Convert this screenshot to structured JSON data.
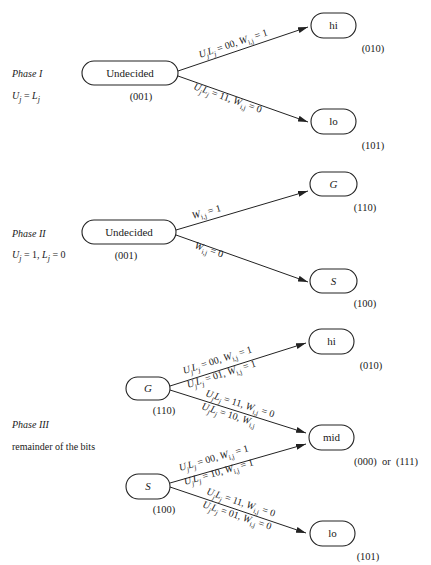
{
  "phases": [
    {
      "title": "Phase I",
      "condition": "U_j = L_j",
      "condition_display": "Uj = Lj",
      "start_node": {
        "label": "Undecided",
        "code": "(001)"
      },
      "edges": [
        {
          "from": "Undecided",
          "to": "hi",
          "labels": [
            "UjLj = 00, Wi,j = 1"
          ]
        },
        {
          "from": "Undecided",
          "to": "lo",
          "labels": [
            "UjLj = 11, Wi,j = 0"
          ]
        }
      ],
      "targets": [
        {
          "label": "hi",
          "code": "(010)"
        },
        {
          "label": "lo",
          "code": "(101)"
        }
      ]
    },
    {
      "title": "Phase II",
      "condition": "U_j = 1, L_j = 0",
      "condition_display": "Uj = 1, Lj = 0",
      "start_node": {
        "label": "Undecided",
        "code": "(001)"
      },
      "edges": [
        {
          "from": "Undecided",
          "to": "G",
          "labels": [
            "Wi,j = 1"
          ]
        },
        {
          "from": "Undecided",
          "to": "S",
          "labels": [
            "Wi,j = 0"
          ]
        }
      ],
      "targets": [
        {
          "label": "G",
          "code": "(110)"
        },
        {
          "label": "S",
          "code": "(100)"
        }
      ]
    },
    {
      "title": "Phase III",
      "condition": "remainder of the bits",
      "sources": [
        {
          "label": "G",
          "code": "(110)"
        },
        {
          "label": "S",
          "code": "(100)"
        }
      ],
      "edges": [
        {
          "from": "G",
          "to": "hi",
          "labels": [
            "UjLj = 00, Wi,j = 1",
            "UjLj = 01, Wi,j = 1"
          ]
        },
        {
          "from": "G",
          "to": "mid",
          "labels": [
            "UjLj = 11, Wi,j = 0",
            "UjLj = 10, Wi,j"
          ]
        },
        {
          "from": "S",
          "to": "mid",
          "labels": [
            "UjLj = 00, Wi,j = 1",
            "UjLj = 10, Wi,j = 1"
          ]
        },
        {
          "from": "S",
          "to": "lo",
          "labels": [
            "UjLj = 11, Wi,j = 0",
            "UjLj = 01, Wi,j = 0"
          ]
        }
      ],
      "targets": [
        {
          "label": "hi",
          "code": "(010)"
        },
        {
          "label": "mid",
          "code": "(000)  or  (111)"
        },
        {
          "label": "lo",
          "code": "(101)"
        }
      ]
    }
  ],
  "text": {
    "p1_title": "Phase I",
    "p1_U": "U",
    "p1_eq": " = ",
    "p1_L": "L",
    "sub_j": "j",
    "p2_title": "Phase II",
    "p2_U": "U",
    "p2_eq1": " = 1, ",
    "p2_L": "L",
    "p2_eq2": " = 0",
    "p3_title": "Phase III",
    "p3_sub": "remainder of the bits",
    "undecided": "Undecided",
    "hi": "hi",
    "lo": "lo",
    "mid": "mid",
    "G": "G",
    "S": "S",
    "c001": "(001)",
    "c010": "(010)",
    "c101": "(101)",
    "c110": "(110)",
    "c100": "(100)",
    "cmid": "(000)  or  (111)",
    "UL": "U",
    "L": "L",
    "W": "W",
    "ij": "i,j",
    "e00_1": " = 00, ",
    "e11_0": " = 11, ",
    "e01_1": " = 01, ",
    "e10": " = 10, ",
    "e01_0": " = 01, ",
    "eq1": " = 1",
    "eq0": " = 0"
  }
}
